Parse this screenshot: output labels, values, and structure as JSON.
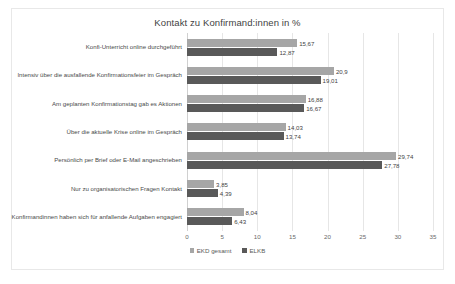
{
  "chart_data": {
    "type": "bar",
    "orientation": "horizontal",
    "title": "Kontakt zu Konfirmand:innen in %",
    "xlabel": "",
    "ylabel": "",
    "xlim": [
      0,
      35
    ],
    "xticks": [
      0,
      5,
      10,
      15,
      20,
      25,
      30,
      35
    ],
    "xtick_labels": [
      "0",
      "5",
      "10",
      "15",
      "20",
      "25",
      "30",
      "35"
    ],
    "grid": true,
    "legend_position": "bottom",
    "categories": [
      "Konfi-Unterricht online durchgeführt",
      "Intensiv über die ausfallende Konfirmationsfeier im Gespräch",
      "Am geplanten Konfirmationstag gab es Aktionen",
      "Über die aktuelle Krise online im Gespräch",
      "Persönlich per Brief oder E-Mail angeschrieben",
      "Nur zu organisatorischen Fragen Kontakt",
      "Konfirmandinnen haben sich für anfallende Aufgaben engagiert"
    ],
    "series": [
      {
        "name": "EKD gesamt",
        "color": "#a6a6a6",
        "values": [
          15.67,
          20.9,
          16.88,
          14.03,
          29.74,
          3.85,
          8.04
        ],
        "labels": [
          "15,67",
          "20,9",
          "16,88",
          "14,03",
          "29,74",
          "3,85",
          "8,04"
        ]
      },
      {
        "name": "ELKB",
        "color": "#595959",
        "values": [
          12.87,
          19.01,
          16.67,
          13.74,
          27.78,
          4.39,
          6.43
        ],
        "labels": [
          "12,87",
          "19,01",
          "16,67",
          "13,74",
          "27,78",
          "4,39",
          "6,43"
        ]
      }
    ]
  },
  "colors": {
    "series_light": "#a6a6a6",
    "series_dark": "#595959",
    "gridline": "#e6e6e6",
    "frame_border": "#e8e8e8",
    "title_text": "#3f3f3f",
    "label_text": "#4a4a4a",
    "tick_text": "#6a6a6a"
  }
}
